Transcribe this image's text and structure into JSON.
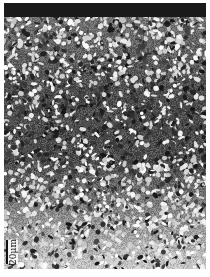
{
  "image": {
    "type": "grayscale-micrograph",
    "description": "Dense granular microstructure; lighter grains near top and bottom, darker in middle",
    "background": "#ffffff",
    "top_band_color": "#1a1a1a"
  },
  "scale_bar": {
    "label": "20μm",
    "orientation": "vertical",
    "color": "#111111"
  }
}
